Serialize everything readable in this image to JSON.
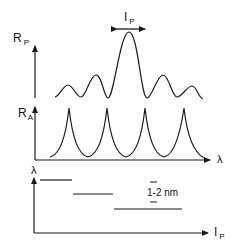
{
  "diagram": {
    "top_panel": {
      "y_label_main": "R",
      "y_label_sub": "P",
      "width_label_main": "I",
      "width_label_sub": "P"
    },
    "middle_panel": {
      "y_label_main": "R",
      "y_label_sub": "A",
      "x_label": "λ"
    },
    "bottom_panel": {
      "y_label": "λ",
      "x_label_main": "I",
      "x_label_sub": "P",
      "step_annotation": "1-2 nm"
    },
    "colors": {
      "stroke": "#1a1a1a",
      "background": "#ffffff"
    }
  }
}
